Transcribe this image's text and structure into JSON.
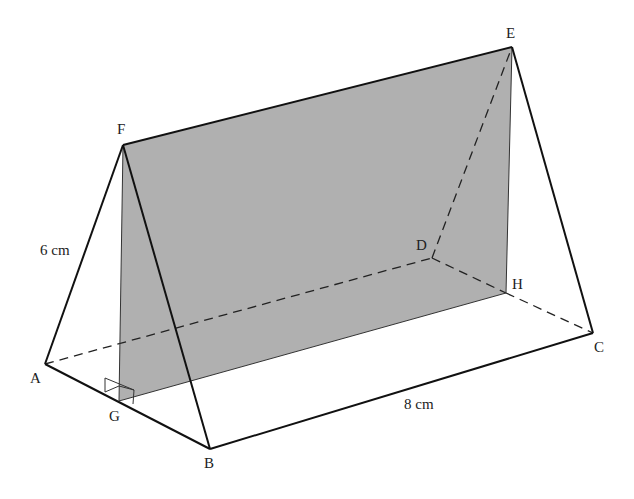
{
  "figure": {
    "type": "triangular prism with shaded plane",
    "shade_color": "#a9a9a9",
    "line_color": "#111111",
    "vertices": {
      "A": {
        "label": "A",
        "x": 45,
        "y": 364,
        "lx": 30,
        "ly": 383
      },
      "B": {
        "label": "B",
        "x": 210,
        "y": 449,
        "lx": 204,
        "ly": 468
      },
      "C": {
        "label": "C",
        "x": 593,
        "y": 333,
        "lx": 594,
        "ly": 352
      },
      "D": {
        "label": "D",
        "x": 432,
        "y": 258,
        "lx": 416,
        "ly": 250
      },
      "E": {
        "label": "E",
        "x": 512,
        "y": 47,
        "lx": 506,
        "ly": 38
      },
      "F": {
        "label": "F",
        "x": 123,
        "y": 145,
        "lx": 117,
        "ly": 134
      },
      "G": {
        "label": "G",
        "x": 119,
        "y": 401,
        "lx": 109,
        "ly": 421
      },
      "H": {
        "label": "H",
        "x": 506,
        "y": 293,
        "lx": 512,
        "ly": 289
      }
    },
    "dimensions": {
      "af_length": "6 cm",
      "bc_length": "8 cm"
    }
  }
}
